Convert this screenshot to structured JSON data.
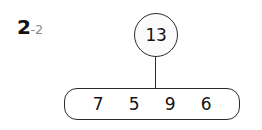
{
  "worksheet": {
    "problem_label": {
      "number": "2",
      "suffix": "-2"
    },
    "number_bond": {
      "total": "13",
      "addends": [
        "7",
        "5",
        "9",
        "6"
      ]
    },
    "colors": {
      "background": "#ffffff",
      "stroke": "#2b2b2b",
      "text": "#141414",
      "label_main": "#111111",
      "label_suffix": "#8a8a8a",
      "circle_fill": "#fbfbfb"
    }
  }
}
